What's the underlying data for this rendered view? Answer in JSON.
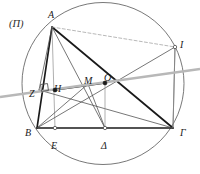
{
  "figure": {
    "tag": "(Π)",
    "tag_pos": {
      "x": 9,
      "y": 18
    },
    "canvas": {
      "width": 200,
      "height": 174
    },
    "background": "#ffffff",
    "colors": {
      "ink": "#1a1a1a",
      "thin": "#4a4a4a",
      "faint": "#8c8c8c",
      "gray_line": "#b3b3b3",
      "circle": "#555555",
      "dashed": "#9a9a9a"
    },
    "circle": {
      "cx": 103,
      "cy": 83.5,
      "r": 81
    },
    "points": [
      {
        "id": "A",
        "label": "A",
        "x": 52,
        "y": 27,
        "label_x": 48,
        "label_y": 10,
        "dot": "none"
      },
      {
        "id": "B",
        "label": "B",
        "x": 37,
        "y": 128,
        "label_x": 25,
        "label_y": 128,
        "dot": "none"
      },
      {
        "id": "Gamma",
        "label": "Γ",
        "x": 173,
        "y": 128,
        "label_x": 180,
        "label_y": 128,
        "dot": "none"
      },
      {
        "id": "Delta",
        "label": "Δ",
        "x": 105,
        "y": 128,
        "label_x": 101,
        "label_y": 141,
        "dot": "open"
      },
      {
        "id": "E",
        "label": "E",
        "x": 55,
        "y": 128,
        "label_x": 51,
        "label_y": 141,
        "dot": "open"
      },
      {
        "id": "Z",
        "label": "Z",
        "x": 39,
        "y": 90,
        "label_x": 29,
        "label_y": 89,
        "dot": "none"
      },
      {
        "id": "H",
        "label": "H",
        "x": 55,
        "y": 90,
        "label_x": 54,
        "label_y": 84,
        "dot": "filled"
      },
      {
        "id": "M",
        "label": "M",
        "x": 88,
        "y": 84,
        "label_x": 84,
        "label_y": 76,
        "dot": "none"
      },
      {
        "id": "O",
        "label": "O",
        "x": 105,
        "y": 83,
        "label_x": 104,
        "label_y": 73,
        "dot": "filled"
      },
      {
        "id": "I",
        "label": "I",
        "x": 175,
        "y": 47,
        "label_x": 180,
        "label_y": 40,
        "dot": "open"
      }
    ],
    "segments": [
      {
        "name": "side-BG",
        "from": "B",
        "to": "Gamma",
        "weight": "bold"
      },
      {
        "name": "side-AB",
        "from": "A",
        "to": "B",
        "weight": "bold"
      },
      {
        "name": "diagonal-AG",
        "from": "A",
        "to": "Gamma",
        "weight": "bold"
      },
      {
        "name": "segment-HO",
        "from": "H",
        "to": "O",
        "weight": "bold"
      },
      {
        "name": "altitude-AE",
        "from": "A",
        "to": "E",
        "weight": "faint"
      },
      {
        "name": "median-AD",
        "from": "A",
        "to": "Delta",
        "weight": "thin"
      },
      {
        "name": "cevian-AZ",
        "from": "A",
        "to": "Z",
        "weight": "thin"
      },
      {
        "name": "cevian-BM",
        "from": "B",
        "to": "M",
        "weight": "thin"
      },
      {
        "name": "segment-BI",
        "from": "B",
        "to": "I",
        "weight": "thin"
      },
      {
        "name": "chord-GI",
        "from": "Gamma",
        "to": "I",
        "weight": "thin"
      },
      {
        "name": "chord-ZG",
        "from": "Z",
        "to": "Gamma",
        "weight": "thin"
      },
      {
        "name": "segment-MD",
        "from": "M",
        "to": "Delta",
        "weight": "thin"
      },
      {
        "name": "segment-OD",
        "from": "O",
        "to": "Delta",
        "weight": "faint"
      },
      {
        "name": "segment-IG-v",
        "from": "I",
        "to": "Gamma",
        "weight": "faint"
      },
      {
        "name": "chord-AI",
        "from": "A",
        "to": "I",
        "weight": "dashed"
      }
    ],
    "transversal": {
      "name": "gray-transversal",
      "x1": 0,
      "y1": 97,
      "x2": 200,
      "y2": 69,
      "color": "#b8b8b8",
      "width": 2.6
    },
    "right_angle_mark": {
      "name": "right-angle-at-Z",
      "x": 41,
      "y": 84,
      "size": 7
    }
  }
}
